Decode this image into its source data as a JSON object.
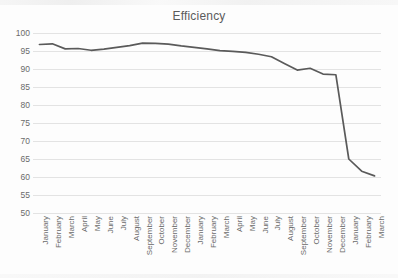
{
  "chart_data": {
    "type": "line",
    "title": "Efficiency",
    "xlabel": "",
    "ylabel": "",
    "ylim": [
      50,
      100
    ],
    "ytick_step": 5,
    "yticks": [
      100,
      95,
      90,
      85,
      80,
      75,
      70,
      65,
      60,
      55,
      50
    ],
    "grid": "horizontal",
    "legend": "none",
    "line_color": "#5a5a5a",
    "gridline_color": "#e3e3e3",
    "background_color": "#fdfdfd",
    "categories": [
      "January",
      "February",
      "March",
      "April",
      "May",
      "June",
      "July",
      "August",
      "September",
      "October",
      "November",
      "December",
      "January",
      "February",
      "March",
      "April",
      "May",
      "June",
      "July",
      "August",
      "September",
      "October",
      "November",
      "December",
      "January",
      "February",
      "March"
    ],
    "series": [
      {
        "name": "Efficiency",
        "values": [
          96.8,
          97.0,
          95.6,
          95.7,
          95.2,
          95.5,
          96.0,
          96.5,
          97.2,
          97.1,
          96.9,
          96.4,
          96.0,
          95.6,
          95.1,
          94.9,
          94.6,
          94.1,
          93.4,
          91.5,
          89.7,
          90.2,
          88.6,
          88.4,
          65.0,
          61.6,
          60.3
        ]
      }
    ]
  },
  "axis": {
    "y_tick_labels": [
      "100",
      "95",
      "90",
      "85",
      "80",
      "75",
      "70",
      "65",
      "60",
      "55",
      "50"
    ]
  }
}
